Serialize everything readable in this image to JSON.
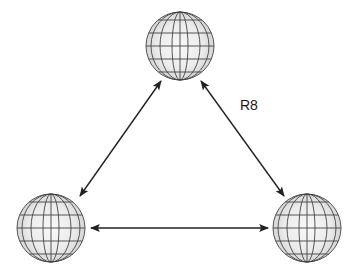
{
  "diagram": {
    "nodes": [
      {
        "id": "top",
        "shape": "globe-sphere",
        "cx": 180,
        "cy": 46,
        "r": 34
      },
      {
        "id": "bottom-left",
        "shape": "globe-sphere",
        "cx": 51,
        "cy": 228,
        "r": 34
      },
      {
        "id": "bottom-right",
        "shape": "globe-sphere",
        "cx": 307,
        "cy": 228,
        "r": 34
      }
    ],
    "edges": [
      {
        "from": "top",
        "to": "bottom-left",
        "type": "bidirectional"
      },
      {
        "from": "top",
        "to": "bottom-right",
        "type": "bidirectional",
        "label": "R8"
      },
      {
        "from": "bottom-left",
        "to": "bottom-right",
        "type": "bidirectional"
      }
    ],
    "labels": {
      "r8": "R8"
    },
    "colors": {
      "sphere_fill": "#e6e6e6",
      "sphere_highlight": "#f7f7f7",
      "grid": "#444444",
      "arrow": "#222222"
    }
  }
}
